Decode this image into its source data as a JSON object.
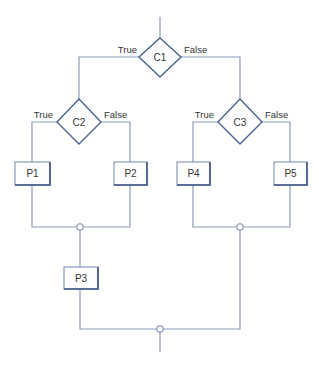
{
  "diagram": {
    "type": "flowchart",
    "colors": {
      "line": "#8a9bb8",
      "shape_border": "#4a6290",
      "text": "#333333",
      "background": "#ffffff"
    },
    "decisions": [
      {
        "id": "C1",
        "label": "C1",
        "true_label": "True",
        "false_label": "False"
      },
      {
        "id": "C2",
        "label": "C2",
        "true_label": "True",
        "false_label": "False"
      },
      {
        "id": "C3",
        "label": "C3",
        "true_label": "True",
        "false_label": "False"
      }
    ],
    "processes": [
      {
        "id": "P1",
        "label": "P1"
      },
      {
        "id": "P2",
        "label": "P2"
      },
      {
        "id": "P3",
        "label": "P3"
      },
      {
        "id": "P4",
        "label": "P4"
      },
      {
        "id": "P5",
        "label": "P5"
      }
    ],
    "edges": [
      {
        "from": "start",
        "to": "C1"
      },
      {
        "from": "C1",
        "to": "C2",
        "label": "True"
      },
      {
        "from": "C1",
        "to": "C3",
        "label": "False"
      },
      {
        "from": "C2",
        "to": "P1",
        "label": "True"
      },
      {
        "from": "C2",
        "to": "P2",
        "label": "False"
      },
      {
        "from": "C3",
        "to": "P4",
        "label": "True"
      },
      {
        "from": "C3",
        "to": "P5",
        "label": "False"
      },
      {
        "from": "P1",
        "to": "J1"
      },
      {
        "from": "P2",
        "to": "J1"
      },
      {
        "from": "J1",
        "to": "P3"
      },
      {
        "from": "P4",
        "to": "J2"
      },
      {
        "from": "P5",
        "to": "J2"
      },
      {
        "from": "P3",
        "to": "J3"
      },
      {
        "from": "J2",
        "to": "J3"
      },
      {
        "from": "J3",
        "to": "end"
      }
    ]
  }
}
